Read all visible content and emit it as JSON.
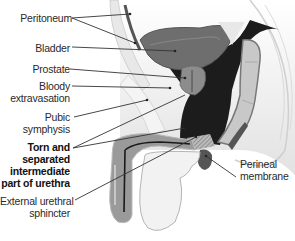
{
  "diagram": {
    "labels": {
      "peritoneum": "Peritoneum",
      "bladder": "Bladder",
      "prostate": "Prostate",
      "bloody_1": "Bloody",
      "bloody_2": "extravasation",
      "pubic_1": "Pubic",
      "pubic_2": "symphysis",
      "torn_1": "Torn and",
      "torn_2": "separated",
      "torn_3": "intermediate",
      "torn_4": "part of urethra",
      "external_1": "External urethral",
      "external_2": "sphincter",
      "perineal_1": "Perineal",
      "perineal_2": "membrane"
    },
    "colors": {
      "extravasation": "#1c1c1c",
      "bladder": "#6e6e6e",
      "prostate": "#8c8c8c",
      "rectum": "#c8c8c8",
      "tissue": "#ececec",
      "leader": "#333333"
    }
  }
}
